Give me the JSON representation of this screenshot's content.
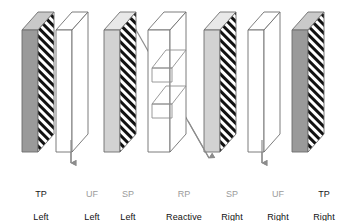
{
  "diagram": {
    "background_color": "#ffffff",
    "colors": {
      "tp_face": "#9a9a9a",
      "tp_top": "#c9c9c9",
      "sp_face": "#d2d2d2",
      "sp_top": "#e8e8e8",
      "uf_face": "#ffffff",
      "uf_top": "#ffffff",
      "rp_face": "#ffffff",
      "hatch_dark": "#111111",
      "outline": "#6e6e6e",
      "arrow": "#8c8c8c",
      "label_abbr_gray": "#9b9b9b",
      "label_abbr_dark": "#1a1a1a",
      "label_desc": "#111111"
    },
    "plates": [
      {
        "id": "tp-left",
        "name": "TP Left",
        "abbr": "TP",
        "desc": "Left",
        "style": "gray-hatched",
        "x": 22,
        "abbr_color": "#1a1a1a"
      },
      {
        "id": "uf-left",
        "name": "UF Left",
        "abbr": "UF",
        "desc": "Left",
        "style": "clear",
        "x": 56,
        "abbr_color": "#9b9b9b"
      },
      {
        "id": "sp-left",
        "name": "SP Left",
        "abbr": "SP",
        "desc": "Left",
        "style": "light-hatched",
        "x": 104,
        "abbr_color": "#9b9b9b"
      },
      {
        "id": "rp-reactive-plate",
        "name": "RP Reactive plate",
        "abbr": "RP",
        "desc": "Reactive\nplate",
        "style": "slotted-clear",
        "x": 148,
        "abbr_color": "#9b9b9b"
      },
      {
        "id": "sp-right",
        "name": "SP Right",
        "abbr": "SP",
        "desc": "Right",
        "style": "light-hatched",
        "x": 204,
        "abbr_color": "#9b9b9b"
      },
      {
        "id": "uf-right",
        "name": "UF Right",
        "abbr": "UF",
        "desc": "Right",
        "style": "clear",
        "x": 248,
        "abbr_color": "#9b9b9b"
      },
      {
        "id": "tp-right",
        "name": "TP Right",
        "abbr": "TP",
        "desc": "Right",
        "style": "gray-hatched",
        "x": 292,
        "abbr_color": "#1a1a1a"
      }
    ],
    "arrows": [
      {
        "id": "arrow-left-vertical",
        "name": "flow-arrow-left",
        "direction": "down"
      },
      {
        "id": "arrow-center-diagonal",
        "name": "flow-arrow-center",
        "direction": "down-right"
      },
      {
        "id": "arrow-right-vertical",
        "name": "flow-arrow-right",
        "direction": "down"
      }
    ]
  },
  "labels": [
    {
      "abbr": "TP",
      "desc": "Left",
      "left": 22,
      "color": "#1a1a1a"
    },
    {
      "abbr": "UF",
      "desc": "Left",
      "left": 78,
      "color": "#9b9b9b"
    },
    {
      "abbr": "SP",
      "desc": "Left",
      "left": 114,
      "color": "#9b9b9b"
    },
    {
      "abbr": "RP",
      "desc": "Reactive\nplate",
      "left": 158,
      "color": "#9b9b9b"
    },
    {
      "abbr": "SP",
      "desc": "Right",
      "left": 216,
      "color": "#9b9b9b"
    },
    {
      "abbr": "UF",
      "desc": "Right",
      "left": 262,
      "color": "#9b9b9b"
    },
    {
      "abbr": "TP",
      "desc": "Right",
      "left": 306,
      "color": "#1a1a1a"
    }
  ]
}
